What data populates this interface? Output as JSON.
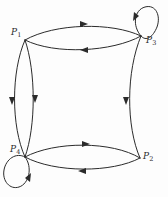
{
  "figure": {
    "background_color": "#fdfdfd",
    "stroke_color": "#2b2b2b",
    "stroke_width": 1
  },
  "vertices": [
    {
      "id": "P1",
      "label": "P",
      "subscript": "1",
      "x": 25,
      "y": 40
    },
    {
      "id": "P3",
      "label": "P",
      "subscript": "3",
      "x": 141,
      "y": 36
    },
    {
      "id": "P4",
      "label": "P",
      "subscript": "4",
      "x": 25,
      "y": 157
    },
    {
      "id": "P2",
      "label": "P",
      "subscript": "2",
      "x": 140,
      "y": 158
    }
  ],
  "edges": [
    {
      "id": "e1",
      "from": "P1",
      "to": "P3",
      "kind": "curved",
      "arrow_direction": "right"
    },
    {
      "id": "e2",
      "from": "P3",
      "to": "P1",
      "kind": "curved",
      "arrow_direction": "left"
    },
    {
      "id": "e3",
      "from": "P1",
      "to": "P4",
      "kind": "curved",
      "arrow_direction": "down"
    },
    {
      "id": "e4",
      "from": "P4",
      "to": "P1",
      "kind": "curved",
      "arrow_direction": "down"
    },
    {
      "id": "e5",
      "from": "P4",
      "to": "P2",
      "kind": "curved",
      "arrow_direction": "right"
    },
    {
      "id": "e6",
      "from": "P2",
      "to": "P4",
      "kind": "curved",
      "arrow_direction": "left"
    },
    {
      "id": "e7",
      "from": "P3",
      "to": "P2",
      "kind": "curved",
      "arrow_direction": "down"
    },
    {
      "id": "e8",
      "from": "P3",
      "to": "P3",
      "kind": "self-loop",
      "arrow_direction": "counter-clockwise"
    },
    {
      "id": "e9",
      "from": "P4",
      "to": "P4",
      "kind": "self-loop",
      "arrow_direction": "counter-clockwise"
    }
  ]
}
